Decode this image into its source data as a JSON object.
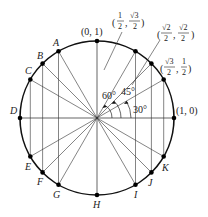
{
  "diagram": {
    "center": [
      97,
      118
    ],
    "radius": 77,
    "colors": {
      "stroke": "#111111",
      "text": "#222222",
      "background": "#ffffff"
    },
    "labeled_points": [
      {
        "label": "(0, 1)",
        "angle_deg": 90
      },
      {
        "label": "(1/2, √3/2)",
        "angle_deg": 60
      },
      {
        "label": "(√2/2, √2/2)",
        "angle_deg": 45
      },
      {
        "label": "(√3/2, 1/2)",
        "angle_deg": 30
      },
      {
        "label": "(1, 0)",
        "angle_deg": 0
      }
    ],
    "letter_points": [
      {
        "label": "A",
        "angle_deg": 120
      },
      {
        "label": "B",
        "angle_deg": 135
      },
      {
        "label": "C",
        "angle_deg": 150
      },
      {
        "label": "D",
        "angle_deg": 180
      },
      {
        "label": "E",
        "angle_deg": 210
      },
      {
        "label": "F",
        "angle_deg": 225
      },
      {
        "label": "G",
        "angle_deg": 240
      },
      {
        "label": "H",
        "angle_deg": 270
      },
      {
        "label": "I",
        "angle_deg": 300
      },
      {
        "label": "J",
        "angle_deg": 315
      },
      {
        "label": "K",
        "angle_deg": 330
      }
    ],
    "angle_labels": [
      {
        "text": "60°",
        "angle_deg": 60
      },
      {
        "text": "45°",
        "angle_deg": 45
      },
      {
        "text": "30°",
        "angle_deg": 30
      }
    ],
    "coords": {
      "top": "(0, 1)",
      "right": "(1, 0)",
      "p60": {
        "x_num": "1",
        "x_den": "2",
        "y_num": "√3",
        "y_den": "2"
      },
      "p45": {
        "x_num": "√2",
        "x_den": "2",
        "y_num": "√2",
        "y_den": "2"
      },
      "p30": {
        "x_num": "√3",
        "x_den": "2",
        "y_num": "1",
        "y_den": "2"
      }
    }
  }
}
